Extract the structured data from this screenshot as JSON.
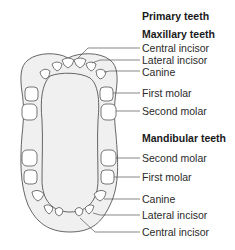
{
  "title": "Primary teeth",
  "maxillary": {
    "heading": "Maxillary teeth",
    "labels": [
      "Central incisor",
      "Lateral incisor",
      "Canine",
      "First molar",
      "Second molar"
    ]
  },
  "mandibular": {
    "heading": "Mandibular teeth",
    "labels": [
      "Second molar",
      "First molar",
      "Canine",
      "Lateral incisor",
      "Central incisor"
    ]
  },
  "colors": {
    "outline": "#555555",
    "palate_fill": "#f0f0f0",
    "text": "#2a2a2a"
  }
}
